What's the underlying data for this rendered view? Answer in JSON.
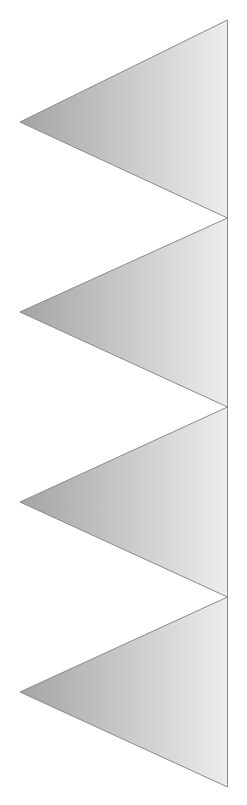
{
  "page": {
    "width": 247,
    "height": 805,
    "background_color": "#ffffff"
  },
  "graphic": {
    "name": "stacked-left-pointing-triangles",
    "description": "Four identical left-pointing triangles stacked vertically, flush to the right edge, each with a light gray left-to-right gradient fill and a thin gray outline.",
    "count": 4,
    "stroke_color": "#8a8a8a",
    "stroke_width": 1,
    "gradient": {
      "id": "triangle-gradient",
      "direction": "horizontal",
      "from_color": "#a4a4a4",
      "to_color": "#ededed",
      "from_x": 20,
      "to_x": 228
    },
    "geometry": {
      "right_edge_x": 227.5,
      "apex_x": 20,
      "top_y": 20,
      "bottom_y": 787,
      "junction_y_values": [
        218,
        407,
        597
      ]
    },
    "shapes": [
      {
        "name": "triangle-1",
        "index": 1,
        "points": "227.5,20 227.5,218 20,122",
        "apex": {
          "x": 20,
          "y": 122
        },
        "top_right": {
          "x": 227.5,
          "y": 20
        },
        "bottom_right": {
          "x": 227.5,
          "y": 218
        }
      },
      {
        "name": "triangle-2",
        "index": 2,
        "points": "227.5,218 227.5,407 20,312",
        "apex": {
          "x": 20,
          "y": 312
        },
        "top_right": {
          "x": 227.5,
          "y": 218
        },
        "bottom_right": {
          "x": 227.5,
          "y": 407
        }
      },
      {
        "name": "triangle-3",
        "index": 3,
        "points": "227.5,407 227.5,597 20,502",
        "apex": {
          "x": 20,
          "y": 502
        },
        "top_right": {
          "x": 227.5,
          "y": 407
        },
        "bottom_right": {
          "x": 227.5,
          "y": 597
        }
      },
      {
        "name": "triangle-4",
        "index": 4,
        "points": "227.5,597 227.5,787 20,692",
        "apex": {
          "x": 20,
          "y": 692
        },
        "top_right": {
          "x": 227.5,
          "y": 597
        },
        "bottom_right": {
          "x": 227.5,
          "y": 787
        }
      }
    ]
  }
}
